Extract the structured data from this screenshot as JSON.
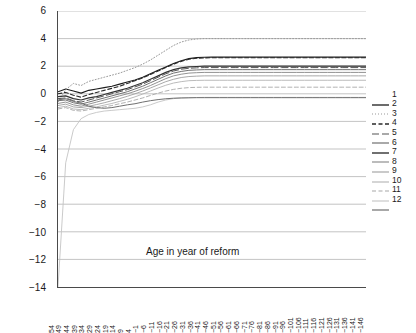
{
  "chart_data": {
    "type": "line",
    "title": "",
    "xlabel": "Age in year of reform",
    "ylabel": "Percentage of lifetime resources",
    "ylim": [
      -14,
      6
    ],
    "ytick_step": 2,
    "yticks": [
      "6",
      "4",
      "2",
      "0",
      "-2",
      "-4",
      "-6",
      "-8",
      "-10",
      "-12",
      "-14"
    ],
    "grid": true,
    "grid_axis": "y",
    "legend_position": "right",
    "xticks": [
      "54",
      "49",
      "44",
      "39",
      "34",
      "29",
      "24",
      "19",
      "14",
      "9",
      "4",
      "-1",
      "-6",
      "-11",
      "-16",
      "-21",
      "-26",
      "-31",
      "-36",
      "-41",
      "-46",
      "-51",
      "-56",
      "-61",
      "-66",
      "-71",
      "-76",
      "-81",
      "-86",
      "-91",
      "-96",
      "-101",
      "-106",
      "-111",
      "-116",
      "-121",
      "-126",
      "-131",
      "-136",
      "-141",
      "-146"
    ],
    "xlim": [
      54,
      -146
    ],
    "x": [
      54,
      49,
      44,
      39,
      34,
      29,
      24,
      19,
      14,
      9,
      4,
      -1,
      -6,
      -11,
      -16,
      -21,
      -26,
      -31,
      -36,
      -41,
      -46,
      -51,
      -56,
      -61,
      -66,
      -71,
      -76,
      -81,
      -86,
      -91,
      -96,
      -101,
      -106,
      -111,
      -116,
      -121,
      -126,
      -131,
      -136,
      -141,
      -146
    ],
    "series": [
      {
        "name": "1",
        "label": "1",
        "style": "solid",
        "color": "#1c1c1c",
        "width": 1.1,
        "values": [
          0.15,
          0.35,
          0.2,
          0.05,
          0.25,
          0.35,
          0.45,
          0.55,
          0.7,
          0.85,
          1.0,
          1.2,
          1.45,
          1.7,
          1.95,
          2.2,
          2.4,
          2.55,
          2.62,
          2.65,
          2.66,
          2.66,
          2.66,
          2.66,
          2.66,
          2.66,
          2.66,
          2.66,
          2.66,
          2.66,
          2.66,
          2.66,
          2.66,
          2.66,
          2.66,
          2.66,
          2.66,
          2.66,
          2.66,
          2.66,
          2.66
        ]
      },
      {
        "name": "2",
        "label": "2",
        "style": "dotted",
        "color": "#9a9a9a",
        "width": 1.0,
        "values": [
          -0.6,
          0.3,
          0.75,
          0.6,
          0.9,
          1.05,
          1.2,
          1.35,
          1.5,
          1.7,
          1.9,
          2.15,
          2.45,
          2.8,
          3.15,
          3.5,
          3.75,
          3.9,
          3.97,
          4.0,
          4.0,
          4.0,
          4.0,
          4.0,
          4.0,
          4.0,
          4.0,
          4.0,
          4.0,
          4.0,
          4.0,
          4.0,
          4.0,
          4.0,
          4.0,
          4.0,
          4.0,
          4.0,
          4.0,
          4.0,
          4.0
        ]
      },
      {
        "name": "3",
        "label": "3",
        "style": "dashed",
        "color": "#2a2a2a",
        "width": 1.1,
        "values": [
          0.0,
          0.1,
          -0.1,
          -0.25,
          -0.05,
          0.1,
          0.25,
          0.4,
          0.55,
          0.75,
          0.95,
          1.15,
          1.4,
          1.65,
          1.9,
          2.15,
          2.35,
          2.5,
          2.58,
          2.6,
          2.61,
          2.61,
          2.61,
          2.61,
          2.61,
          2.61,
          2.61,
          2.61,
          2.61,
          2.61,
          2.61,
          2.61,
          2.61,
          2.61,
          2.61,
          2.61,
          2.61,
          2.61,
          2.61,
          2.61,
          2.61
        ]
      },
      {
        "name": "4",
        "label": "4",
        "style": "dashed-long",
        "color": "#555555",
        "width": 1.0,
        "values": [
          -0.35,
          -0.3,
          -0.5,
          -0.6,
          -0.45,
          -0.3,
          -0.15,
          0.0,
          0.15,
          0.3,
          0.5,
          0.7,
          0.95,
          1.2,
          1.45,
          1.65,
          1.78,
          1.85,
          1.88,
          1.9,
          1.9,
          1.9,
          1.9,
          1.9,
          1.9,
          1.9,
          1.9,
          1.9,
          1.9,
          1.9,
          1.9,
          1.9,
          1.9,
          1.9,
          1.9,
          1.9,
          1.9,
          1.9,
          1.9,
          1.9,
          1.9
        ]
      },
      {
        "name": "5",
        "label": "5",
        "style": "solid",
        "color": "#707070",
        "width": 1.0,
        "values": [
          -0.5,
          -0.45,
          -0.65,
          -0.75,
          -0.6,
          -0.45,
          -0.3,
          -0.15,
          0.0,
          0.15,
          0.35,
          0.55,
          0.8,
          1.05,
          1.3,
          1.5,
          1.62,
          1.7,
          1.73,
          1.75,
          1.75,
          1.75,
          1.75,
          1.75,
          1.75,
          1.75,
          1.75,
          1.75,
          1.75,
          1.75,
          1.75,
          1.75,
          1.75,
          1.75,
          1.75,
          1.75,
          1.75,
          1.75,
          1.75,
          1.75,
          1.75
        ]
      },
      {
        "name": "6",
        "label": "6",
        "style": "solid",
        "color": "#333333",
        "width": 1.2,
        "values": [
          -0.2,
          -0.15,
          -0.35,
          -0.45,
          -0.3,
          -0.2,
          -0.05,
          0.1,
          0.25,
          0.4,
          0.6,
          0.8,
          1.05,
          1.3,
          1.55,
          1.75,
          1.88,
          1.95,
          1.98,
          2.0,
          2.0,
          2.0,
          2.0,
          2.0,
          2.0,
          2.0,
          2.0,
          2.0,
          2.0,
          2.0,
          2.0,
          2.0,
          2.0,
          2.0,
          2.0,
          2.0,
          2.0,
          2.0,
          2.0,
          2.0,
          2.0
        ]
      },
      {
        "name": "7",
        "label": "7",
        "style": "solid",
        "color": "#858585",
        "width": 0.9,
        "values": [
          -0.7,
          -0.6,
          -0.8,
          -0.9,
          -0.75,
          -0.6,
          -0.45,
          -0.3,
          -0.15,
          0.0,
          0.18,
          0.38,
          0.6,
          0.85,
          1.1,
          1.3,
          1.42,
          1.5,
          1.53,
          1.55,
          1.55,
          1.55,
          1.55,
          1.55,
          1.55,
          1.55,
          1.55,
          1.55,
          1.55,
          1.55,
          1.55,
          1.55,
          1.55,
          1.55,
          1.55,
          1.55,
          1.55,
          1.55,
          1.55,
          1.55,
          1.55
        ]
      },
      {
        "name": "8",
        "label": "8",
        "style": "solid",
        "color": "#9e9e9e",
        "width": 0.9,
        "values": [
          -0.85,
          -0.75,
          -0.95,
          -1.0,
          -0.9,
          -0.78,
          -0.65,
          -0.5,
          -0.35,
          -0.18,
          0.0,
          0.2,
          0.42,
          0.65,
          0.88,
          1.05,
          1.18,
          1.25,
          1.28,
          1.3,
          1.3,
          1.3,
          1.3,
          1.3,
          1.3,
          1.3,
          1.3,
          1.3,
          1.3,
          1.3,
          1.3,
          1.3,
          1.3,
          1.3,
          1.3,
          1.3,
          1.3,
          1.3,
          1.3,
          1.3,
          1.3
        ]
      },
      {
        "name": "9",
        "label": "9",
        "style": "solid",
        "color": "#b3b3b3",
        "width": 0.9,
        "values": [
          -1.0,
          -0.9,
          -1.1,
          -1.15,
          -1.05,
          -0.95,
          -0.82,
          -0.7,
          -0.55,
          -0.4,
          -0.22,
          -0.02,
          0.2,
          0.42,
          0.62,
          0.78,
          0.88,
          0.95,
          0.97,
          0.98,
          0.98,
          0.98,
          0.98,
          0.98,
          0.98,
          0.98,
          0.98,
          0.98,
          0.98,
          0.98,
          0.98,
          0.98,
          0.98,
          0.98,
          0.98,
          0.98,
          0.98,
          0.98,
          0.98,
          0.98,
          0.98
        ]
      },
      {
        "name": "10",
        "label": "10",
        "style": "dashed",
        "color": "#a8a8a8",
        "width": 0.9,
        "values": [
          -1.1,
          -1.0,
          -1.2,
          -1.25,
          -1.15,
          -1.05,
          -0.95,
          -0.85,
          -0.72,
          -0.6,
          -0.45,
          -0.3,
          -0.12,
          0.05,
          0.2,
          0.32,
          0.4,
          0.45,
          0.47,
          0.48,
          0.48,
          0.48,
          0.48,
          0.48,
          0.48,
          0.48,
          0.48,
          0.48,
          0.48,
          0.48,
          0.48,
          0.48,
          0.48,
          0.48,
          0.48,
          0.48,
          0.48,
          0.48,
          0.48,
          0.48,
          0.48
        ]
      },
      {
        "name": "11",
        "label": "11",
        "style": "solid",
        "color": "#c4c4c4",
        "width": 0.9,
        "values": [
          -14.0,
          -5.0,
          -2.6,
          -1.8,
          -1.5,
          -1.35,
          -1.25,
          -1.2,
          -1.15,
          -1.1,
          -1.05,
          -0.95,
          -0.8,
          -0.6,
          -0.45,
          -0.35,
          -0.3,
          -0.28,
          -0.27,
          -0.26,
          -0.26,
          -0.26,
          -0.26,
          -0.26,
          -0.26,
          -0.26,
          -0.26,
          -0.26,
          -0.26,
          -0.26,
          -0.26,
          -0.26,
          -0.26,
          -0.26,
          -0.26,
          -0.26,
          -0.26,
          -0.26,
          -0.26,
          -0.26,
          -0.26
        ]
      },
      {
        "name": "12",
        "label": "12",
        "style": "solid",
        "color": "#6e6e6e",
        "width": 1.0,
        "values": [
          -0.45,
          -0.35,
          -0.55,
          -0.68,
          -0.9,
          -1.0,
          -1.05,
          -1.0,
          -0.9,
          -0.8,
          -0.72,
          -0.6,
          -0.5,
          -0.42,
          -0.36,
          -0.32,
          -0.3,
          -0.29,
          -0.28,
          -0.28,
          -0.28,
          -0.28,
          -0.28,
          -0.28,
          -0.28,
          -0.28,
          -0.28,
          -0.28,
          -0.28,
          -0.28,
          -0.28,
          -0.28,
          -0.28,
          -0.28,
          -0.28,
          -0.28,
          -0.28,
          -0.28,
          -0.28,
          -0.28,
          -0.28
        ]
      }
    ]
  }
}
